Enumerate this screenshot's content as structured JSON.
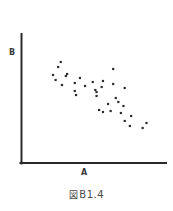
{
  "figure": {
    "caption_symbol": "図",
    "caption_number": "B1.4",
    "caption_full": "図 B1.4"
  },
  "chart_data": {
    "type": "scatter",
    "title": "",
    "xlabel": "A",
    "ylabel": "B",
    "grid": false,
    "legend": "none",
    "axis_style": "open-L-axes-no-ticks",
    "xlim": [
      0,
      100
    ],
    "ylim": [
      0,
      100
    ],
    "marker": {
      "shape": "square-dot",
      "color": "#2b2b2b",
      "size_px": 2.2
    },
    "relationship": "negative correlation",
    "n_points": 34,
    "x": [
      24,
      22,
      18,
      28,
      20,
      29,
      39,
      35,
      25,
      49,
      57,
      65,
      43,
      56,
      35,
      51,
      65,
      52,
      36,
      52,
      67,
      69,
      74,
      61,
      73,
      54,
      57,
      63,
      71,
      79,
      74,
      91,
      78,
      88
    ],
    "y": [
      86,
      81,
      73,
      72,
      68,
      74,
      70,
      65,
      63,
      66,
      67,
      64,
      62,
      61,
      57,
      58,
      79,
      56,
      53,
      52,
      50,
      46,
      60,
      44,
      42,
      38,
      36,
      37,
      35,
      32,
      27,
      25,
      22,
      20
    ],
    "points": [
      {
        "x": 24,
        "y": 86
      },
      {
        "x": 22,
        "y": 81
      },
      {
        "x": 18,
        "y": 73
      },
      {
        "x": 28,
        "y": 72
      },
      {
        "x": 20,
        "y": 68
      },
      {
        "x": 29,
        "y": 74
      },
      {
        "x": 39,
        "y": 70
      },
      {
        "x": 35,
        "y": 65
      },
      {
        "x": 25,
        "y": 63
      },
      {
        "x": 49,
        "y": 66
      },
      {
        "x": 57,
        "y": 67
      },
      {
        "x": 65,
        "y": 64
      },
      {
        "x": 43,
        "y": 62
      },
      {
        "x": 56,
        "y": 61
      },
      {
        "x": 35,
        "y": 57
      },
      {
        "x": 51,
        "y": 58
      },
      {
        "x": 65,
        "y": 79
      },
      {
        "x": 52,
        "y": 56
      },
      {
        "x": 36,
        "y": 53
      },
      {
        "x": 52,
        "y": 52
      },
      {
        "x": 67,
        "y": 50
      },
      {
        "x": 69,
        "y": 46
      },
      {
        "x": 74,
        "y": 60
      },
      {
        "x": 61,
        "y": 44
      },
      {
        "x": 73,
        "y": 42
      },
      {
        "x": 54,
        "y": 38
      },
      {
        "x": 57,
        "y": 36
      },
      {
        "x": 63,
        "y": 37
      },
      {
        "x": 71,
        "y": 35
      },
      {
        "x": 79,
        "y": 32
      },
      {
        "x": 74,
        "y": 27
      },
      {
        "x": 91,
        "y": 25
      },
      {
        "x": 78,
        "y": 22
      },
      {
        "x": 88,
        "y": 20
      }
    ],
    "colors": {
      "axis": "#2a2a2a",
      "marker": "#2b2b2b",
      "label": "#3a3a3a",
      "background": "#ffffff"
    }
  }
}
